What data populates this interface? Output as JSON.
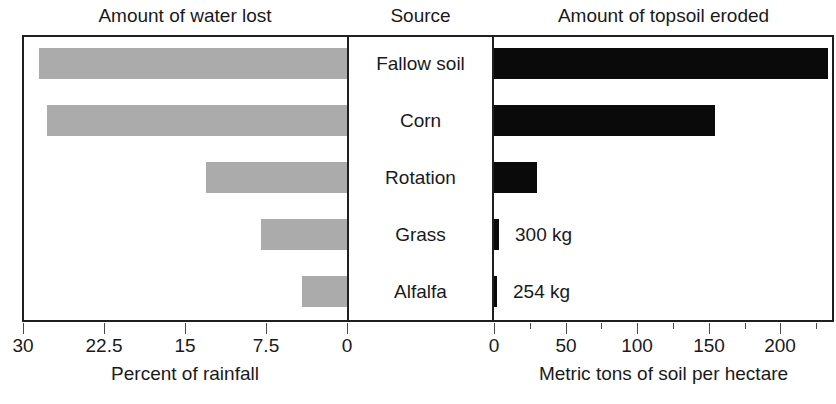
{
  "headings": {
    "left": "Amount of water lost",
    "center": "Source",
    "right": "Amount of topsoil eroded"
  },
  "colors": {
    "water_bar": "#ababab",
    "soil_bar": "#0a0a0a",
    "frame": "#1f1f1f",
    "text": "#1a1a1a"
  },
  "chart_data": {
    "type": "bar",
    "orientation": "horizontal",
    "layout": "bidirectional-paired-panels",
    "title": "",
    "categories": [
      "Fallow soil",
      "Corn",
      "Rotation",
      "Grass",
      "Alfalfa"
    ],
    "series": [
      {
        "name": "Amount of water lost",
        "panel": "left",
        "direction": "right-to-left",
        "xlabel": "Percent of rainfall",
        "unit": "percent",
        "values": [
          28.5,
          27.8,
          13.1,
          8.0,
          4.2
        ],
        "xlim": [
          0,
          30
        ],
        "ticks": [
          30,
          22.5,
          15,
          7.5,
          0
        ],
        "tick_labels": [
          "30",
          "22.5",
          "15",
          "7.5",
          "0"
        ],
        "color": "#ababab"
      },
      {
        "name": "Amount of topsoil eroded",
        "panel": "right",
        "direction": "left-to-right",
        "xlabel": "Metric tons of soil per hectare",
        "unit": "metric tons per hectare",
        "values": [
          233,
          154,
          30,
          0.3,
          0.254
        ],
        "value_annotations": [
          "",
          "",
          "",
          "300 kg",
          "254 kg"
        ],
        "xlim": [
          0,
          236
        ],
        "ticks": [
          0,
          25,
          50,
          75,
          100,
          125,
          150,
          175,
          200,
          225
        ],
        "major_ticks": [
          0,
          50,
          100,
          150,
          200
        ],
        "tick_labels": [
          "0",
          "50",
          "100",
          "150",
          "200"
        ],
        "color": "#0a0a0a"
      }
    ],
    "center_panel_label": "Source",
    "grid": false,
    "legend": "none"
  }
}
